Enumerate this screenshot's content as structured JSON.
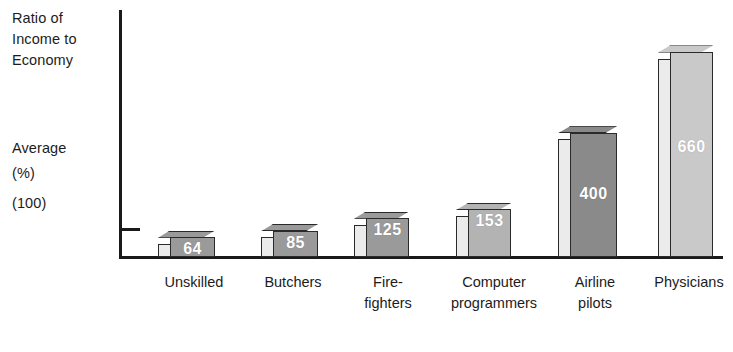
{
  "chart_data": {
    "type": "bar",
    "title": "Ratio of Income to Economy",
    "ylabel": "Ratio of Income to Economy\nAverage (%)",
    "xlabel": "",
    "axis_caption_title": "Ratio of\nIncome to\nEconomy",
    "axis_caption_average": "Average",
    "axis_caption_percent": "(%)",
    "axis_caption_baseline": "(100)",
    "baseline_reference": 100,
    "grid": false,
    "legend": "none",
    "ylim": [
      0,
      660
    ],
    "categories": [
      "Unskilled",
      "Butchers",
      "Fire-\nfighters",
      "Computer\nprogrammers",
      "Airline\npilots",
      "Physicians"
    ],
    "values": [
      64,
      85,
      125,
      153,
      400,
      660
    ],
    "value_labels": [
      "64",
      "85",
      "125",
      "153",
      "400",
      "660"
    ],
    "bar_colors": [
      "#9a9a9a",
      "#9a9a9a",
      "#9a9a9a",
      "#b3b3b3",
      "#8a8a8a",
      "#c9c9c9"
    ],
    "units": "percent of economy average",
    "bars": [
      {
        "category": "Unskilled",
        "value": 64,
        "label": "64",
        "color": "#9a9a9a"
      },
      {
        "category": "Butchers",
        "value": 85,
        "label": "85",
        "color": "#9a9a9a"
      },
      {
        "category": "Fire-fighters",
        "value": 125,
        "label": "125",
        "color": "#9a9a9a"
      },
      {
        "category": "Computer programmers",
        "value": 153,
        "label": "153",
        "color": "#b3b3b3"
      },
      {
        "category": "Airline pilots",
        "value": 400,
        "label": "400",
        "color": "#8a8a8a"
      },
      {
        "category": "Physicians",
        "value": 660,
        "label": "660",
        "color": "#c9c9c9"
      }
    ]
  },
  "colors": {
    "axis": "#1a1a1a",
    "bar_outline": "#2a2a2a",
    "bar_side": "#ebebeb",
    "bar_top": "#d9d9d9",
    "value_text": "#ffffff",
    "label_text": "#1c1c1c",
    "background": "#ffffff"
  }
}
